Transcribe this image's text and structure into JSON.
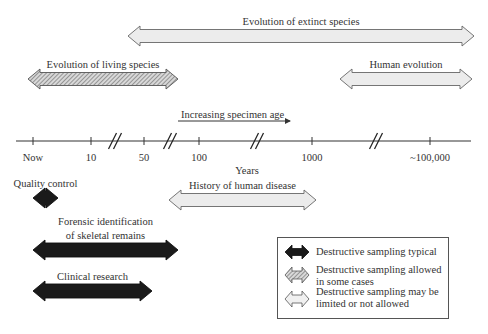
{
  "colors": {
    "typical": "#1a1a1a",
    "some_cases": "#b8b8b8",
    "limited": "#ececec",
    "outline": "#555555",
    "axis": "#333333"
  },
  "axis": {
    "title": "Years",
    "ticks": [
      {
        "label": "Now",
        "x": 33
      },
      {
        "label": "10",
        "x": 91
      },
      {
        "label": "50",
        "x": 144
      },
      {
        "label": "100",
        "x": 199
      },
      {
        "label": "1000",
        "x": 312
      },
      {
        "label": "~100,000",
        "x": 430
      }
    ],
    "breaks": [
      115,
      170,
      257,
      376
    ],
    "direction_label": "Increasing specimen age"
  },
  "ranges": [
    {
      "id": "extinct",
      "label": "Evolution of extinct species",
      "category": "limited",
      "x1": 128,
      "x2": 474,
      "y": 36
    },
    {
      "id": "living",
      "label": "Evolution of living species",
      "category": "some_cases",
      "x1": 28,
      "x2": 178,
      "y": 79
    },
    {
      "id": "human-evolution",
      "label": "Human evolution",
      "category": "limited",
      "x1": 340,
      "x2": 472,
      "y": 79
    },
    {
      "id": "quality-control",
      "label": "Quality control",
      "category": "typical",
      "x1": 33,
      "x2": 58,
      "y": 198
    },
    {
      "id": "human-disease",
      "label": "History of human disease",
      "category": "limited",
      "x1": 169,
      "x2": 316,
      "y": 200
    },
    {
      "id": "forensic",
      "label": "Forensic identification of skeletal remains",
      "label_lines": [
        "Forensic identification",
        "of skeletal remains"
      ],
      "category": "typical",
      "x1": 33,
      "x2": 178,
      "y": 250
    },
    {
      "id": "clinical",
      "label": "Clinical research",
      "category": "typical",
      "x1": 33,
      "x2": 152,
      "y": 291
    }
  ],
  "legend": {
    "items": [
      {
        "category": "typical",
        "label_lines": [
          "Destructive sampling typical"
        ]
      },
      {
        "category": "some_cases",
        "label_lines": [
          "Destructive sampling allowed",
          "in some cases"
        ]
      },
      {
        "category": "limited",
        "label_lines": [
          "Destructive sampling may be",
          "limited or not allowed"
        ]
      }
    ]
  }
}
